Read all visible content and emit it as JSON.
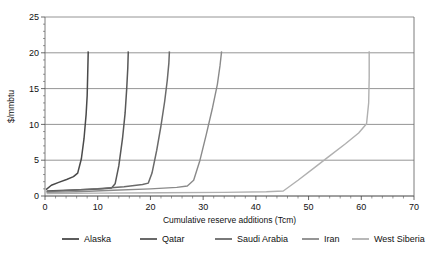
{
  "chart_data": {
    "type": "line",
    "title": "",
    "xlabel": "Cumulative reserve additions (Tcm)",
    "ylabel": "$/mmbtu",
    "xlim": [
      0,
      70
    ],
    "ylim": [
      0,
      25
    ],
    "xticks": [
      0,
      10,
      20,
      30,
      40,
      50,
      60,
      70
    ],
    "yticks": [
      0,
      5,
      10,
      15,
      20,
      25
    ],
    "xtick_labels": [
      "0",
      "10",
      "20",
      "30",
      "40",
      "50",
      "60",
      "70"
    ],
    "ytick_labels": [
      "0",
      "5",
      "10",
      "15",
      "20",
      "25"
    ],
    "minor_tick_step": 2,
    "grid": "horizontal",
    "legend_position": "bottom",
    "series": [
      {
        "name": "Alaska",
        "color": "#4a4a4a",
        "width": 1.5,
        "points": [
          [
            0.2,
            0.9
          ],
          [
            1.2,
            1.5
          ],
          [
            2.6,
            1.9
          ],
          [
            4.1,
            2.3
          ],
          [
            5.4,
            2.7
          ],
          [
            6.2,
            3.2
          ],
          [
            6.9,
            5.2
          ],
          [
            7.4,
            8.0
          ],
          [
            7.8,
            11.4
          ],
          [
            8.0,
            14.0
          ],
          [
            8.1,
            17.0
          ],
          [
            8.2,
            20.2
          ]
        ]
      },
      {
        "name": "Qatar",
        "color": "#585858",
        "width": 1.5,
        "points": [
          [
            0.3,
            0.7
          ],
          [
            4.0,
            0.8
          ],
          [
            8.0,
            0.9
          ],
          [
            11.0,
            1.0
          ],
          [
            12.6,
            1.1
          ],
          [
            13.3,
            1.7
          ],
          [
            14.0,
            4.2
          ],
          [
            14.7,
            8.0
          ],
          [
            15.2,
            11.6
          ],
          [
            15.5,
            15.0
          ],
          [
            15.7,
            17.8
          ],
          [
            15.8,
            20.2
          ]
        ]
      },
      {
        "name": "Saudi Arabia",
        "color": "#6a6a6a",
        "width": 1.5,
        "points": [
          [
            0.3,
            0.6
          ],
          [
            5.0,
            0.8
          ],
          [
            10.0,
            1.0
          ],
          [
            15.0,
            1.3
          ],
          [
            18.5,
            1.6
          ],
          [
            19.6,
            1.8
          ],
          [
            20.3,
            3.2
          ],
          [
            21.2,
            6.4
          ],
          [
            22.0,
            9.8
          ],
          [
            22.7,
            13.2
          ],
          [
            23.2,
            16.2
          ],
          [
            23.5,
            18.6
          ],
          [
            23.6,
            20.2
          ]
        ]
      },
      {
        "name": "Iran",
        "color": "#8a8a8a",
        "width": 1.4,
        "points": [
          [
            0.3,
            0.5
          ],
          [
            6.0,
            0.6
          ],
          [
            13.0,
            0.8
          ],
          [
            20.0,
            1.0
          ],
          [
            25.0,
            1.2
          ],
          [
            27.0,
            1.4
          ],
          [
            28.2,
            2.2
          ],
          [
            29.4,
            5.0
          ],
          [
            30.6,
            8.6
          ],
          [
            31.8,
            12.4
          ],
          [
            32.7,
            15.6
          ],
          [
            33.2,
            18.2
          ],
          [
            33.5,
            20.2
          ]
        ]
      },
      {
        "name": "West Siberia",
        "color": "#b0b0b0",
        "width": 1.4,
        "points": [
          [
            0.3,
            0.35
          ],
          [
            10.0,
            0.4
          ],
          [
            22.0,
            0.45
          ],
          [
            34.0,
            0.5
          ],
          [
            42.0,
            0.6
          ],
          [
            45.2,
            0.7
          ],
          [
            48.0,
            2.2
          ],
          [
            51.0,
            3.9
          ],
          [
            54.0,
            5.6
          ],
          [
            57.0,
            7.3
          ],
          [
            59.5,
            8.8
          ],
          [
            61.0,
            10.1
          ],
          [
            61.4,
            13.0
          ],
          [
            61.5,
            16.5
          ],
          [
            61.5,
            20.2
          ]
        ]
      }
    ],
    "legend": [
      {
        "label": "Alaska",
        "color": "#4a4a4a"
      },
      {
        "label": "Qatar",
        "color": "#585858"
      },
      {
        "label": "Saudi Arabia",
        "color": "#6a6a6a"
      },
      {
        "label": "Iran",
        "color": "#8a8a8a"
      },
      {
        "label": "West Siberia",
        "color": "#b0b0b0"
      }
    ]
  },
  "plot": {
    "left": 45,
    "right": 414,
    "top": 17,
    "bottom": 196
  },
  "legend_layout": {
    "y": 239,
    "entries_x": [
      62,
      140,
      215,
      302,
      352
    ],
    "line_len": 17,
    "gap": 5
  }
}
